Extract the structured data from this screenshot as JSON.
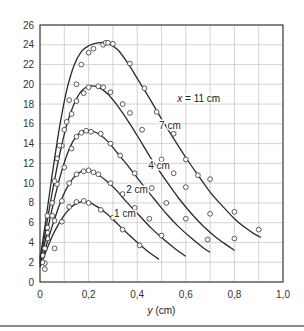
{
  "chart_data": {
    "type": "line",
    "title": "",
    "xlabel": "y (cm)",
    "xlabel_italic": "y",
    "xlabel_unit": " (cm)",
    "ylabel": "",
    "xlim": [
      0,
      1.0
    ],
    "ylim": [
      0,
      26
    ],
    "xticks": [
      0,
      0.2,
      0.4,
      0.6,
      0.8,
      1.0
    ],
    "xtick_labels": [
      "0",
      "0,2",
      "0,4",
      "0,6",
      "0,8",
      "1,0"
    ],
    "xgrid": [
      0,
      0.1,
      0.2,
      0.3,
      0.4,
      0.5,
      0.6,
      0.7,
      0.8,
      0.9,
      1.0
    ],
    "yticks": [
      0,
      2,
      4,
      6,
      8,
      10,
      12,
      14,
      16,
      18,
      20,
      22,
      24,
      26
    ],
    "ytick_labels": [
      "0",
      "2",
      "4",
      "6",
      "8",
      "10",
      "12",
      "14",
      "16",
      "18",
      "20",
      "22",
      "24",
      "26"
    ],
    "grid": true,
    "legend": "inline curve labels",
    "series": [
      {
        "name": "1 cm",
        "label": "1 cm",
        "label_pos": [
          0.305,
          6.9
        ],
        "curve": [
          [
            0.0,
            1.5
          ],
          [
            0.02,
            2.8
          ],
          [
            0.05,
            4.6
          ],
          [
            0.08,
            6.0
          ],
          [
            0.11,
            7.1
          ],
          [
            0.14,
            7.8
          ],
          [
            0.17,
            8.1
          ],
          [
            0.2,
            8.05
          ],
          [
            0.23,
            7.7
          ],
          [
            0.27,
            7.0
          ],
          [
            0.31,
            6.1
          ],
          [
            0.36,
            4.9
          ],
          [
            0.41,
            3.8
          ],
          [
            0.46,
            2.8
          ],
          [
            0.49,
            2.3
          ]
        ],
        "points": [
          [
            0.02,
            1.3
          ],
          [
            0.02,
            1.9
          ],
          [
            0.06,
            3.4
          ],
          [
            0.09,
            6.1
          ],
          [
            0.12,
            7.6
          ],
          [
            0.15,
            8.1
          ],
          [
            0.18,
            8.2
          ],
          [
            0.2,
            8.0
          ],
          [
            0.25,
            7.3
          ],
          [
            0.3,
            6.5
          ],
          [
            0.34,
            5.3
          ],
          [
            0.41,
            3.7
          ]
        ]
      },
      {
        "name": "2 cm",
        "label": "2 cm",
        "label_pos": [
          0.355,
          9.4
        ],
        "curve": [
          [
            0.0,
            1.6
          ],
          [
            0.02,
            3.2
          ],
          [
            0.05,
            5.6
          ],
          [
            0.08,
            7.8
          ],
          [
            0.11,
            9.5
          ],
          [
            0.14,
            10.6
          ],
          [
            0.17,
            11.2
          ],
          [
            0.2,
            11.25
          ],
          [
            0.23,
            11.0
          ],
          [
            0.27,
            10.3
          ],
          [
            0.31,
            9.4
          ],
          [
            0.36,
            8.0
          ],
          [
            0.41,
            6.7
          ],
          [
            0.46,
            5.4
          ],
          [
            0.51,
            4.3
          ],
          [
            0.56,
            3.3
          ],
          [
            0.6,
            2.6
          ]
        ],
        "points": [
          [
            0.01,
            2.0
          ],
          [
            0.03,
            4.4
          ],
          [
            0.06,
            6.2
          ],
          [
            0.09,
            8.2
          ],
          [
            0.12,
            10.0
          ],
          [
            0.15,
            10.9
          ],
          [
            0.18,
            11.2
          ],
          [
            0.2,
            11.3
          ],
          [
            0.22,
            11.1
          ],
          [
            0.24,
            10.9
          ],
          [
            0.29,
            10.0
          ],
          [
            0.34,
            8.9
          ],
          [
            0.39,
            7.5
          ],
          [
            0.45,
            6.4
          ],
          [
            0.5,
            4.7
          ]
        ]
      },
      {
        "name": "4 cm",
        "label": "4 cm",
        "label_pos": [
          0.445,
          11.8
        ],
        "curve": [
          [
            0.0,
            1.8
          ],
          [
            0.02,
            4.0
          ],
          [
            0.05,
            7.4
          ],
          [
            0.08,
            10.4
          ],
          [
            0.11,
            12.8
          ],
          [
            0.14,
            14.4
          ],
          [
            0.17,
            15.2
          ],
          [
            0.21,
            15.3
          ],
          [
            0.24,
            15.0
          ],
          [
            0.28,
            14.2
          ],
          [
            0.32,
            13.0
          ],
          [
            0.37,
            11.5
          ],
          [
            0.42,
            9.9
          ],
          [
            0.47,
            8.4
          ],
          [
            0.52,
            6.9
          ],
          [
            0.57,
            5.6
          ],
          [
            0.62,
            4.5
          ],
          [
            0.67,
            3.5
          ],
          [
            0.7,
            3.0
          ]
        ],
        "points": [
          [
            0.01,
            2.6
          ],
          [
            0.03,
            5.0
          ],
          [
            0.05,
            6.7
          ],
          [
            0.07,
            9.9
          ],
          [
            0.1,
            11.6
          ],
          [
            0.13,
            13.5
          ],
          [
            0.15,
            14.7
          ],
          [
            0.17,
            15.1
          ],
          [
            0.19,
            15.3
          ],
          [
            0.21,
            15.2
          ],
          [
            0.25,
            15.0
          ],
          [
            0.29,
            14.0
          ],
          [
            0.33,
            12.8
          ],
          [
            0.39,
            11.0
          ],
          [
            0.46,
            9.5
          ],
          [
            0.52,
            8.0
          ],
          [
            0.6,
            6.4
          ],
          [
            0.69,
            4.3
          ]
        ]
      },
      {
        "name": "7 cm",
        "label": "7 cm",
        "label_pos": [
          0.49,
          15.8
        ],
        "curve": [
          [
            0.0,
            2.0
          ],
          [
            0.02,
            4.8
          ],
          [
            0.05,
            9.0
          ],
          [
            0.08,
            12.8
          ],
          [
            0.11,
            15.9
          ],
          [
            0.14,
            18.0
          ],
          [
            0.17,
            19.3
          ],
          [
            0.2,
            19.8
          ],
          [
            0.24,
            19.7
          ],
          [
            0.28,
            19.0
          ],
          [
            0.32,
            17.8
          ],
          [
            0.37,
            16.0
          ],
          [
            0.42,
            14.0
          ],
          [
            0.47,
            12.0
          ],
          [
            0.52,
            10.2
          ],
          [
            0.57,
            8.5
          ],
          [
            0.62,
            7.0
          ],
          [
            0.67,
            5.7
          ],
          [
            0.72,
            4.6
          ],
          [
            0.77,
            3.7
          ],
          [
            0.8,
            3.2
          ]
        ],
        "points": [
          [
            0.01,
            2.7
          ],
          [
            0.03,
            5.5
          ],
          [
            0.05,
            8.0
          ],
          [
            0.07,
            12.5
          ],
          [
            0.09,
            13.8
          ],
          [
            0.11,
            16.2
          ],
          [
            0.13,
            17.0
          ],
          [
            0.15,
            18.3
          ],
          [
            0.18,
            19.1
          ],
          [
            0.2,
            19.7
          ],
          [
            0.24,
            19.8
          ],
          [
            0.26,
            19.7
          ],
          [
            0.29,
            19.2
          ],
          [
            0.34,
            18.0
          ],
          [
            0.37,
            17.1
          ],
          [
            0.42,
            15.4
          ],
          [
            0.5,
            12.4
          ],
          [
            0.55,
            11.0
          ],
          [
            0.6,
            9.6
          ],
          [
            0.7,
            6.9
          ],
          [
            0.8,
            4.4
          ]
        ]
      },
      {
        "name": "11 cm",
        "label": "x = 11 cm",
        "label_italic": "x",
        "label_rest": " = 11 cm",
        "label_pos": [
          0.565,
          18.6
        ],
        "curve": [
          [
            0.0,
            2.3
          ],
          [
            0.02,
            5.6
          ],
          [
            0.05,
            10.8
          ],
          [
            0.08,
            15.6
          ],
          [
            0.11,
            19.4
          ],
          [
            0.14,
            21.9
          ],
          [
            0.17,
            23.3
          ],
          [
            0.2,
            23.9
          ],
          [
            0.24,
            24.2
          ],
          [
            0.28,
            24.15
          ],
          [
            0.32,
            23.5
          ],
          [
            0.36,
            22.2
          ],
          [
            0.4,
            20.6
          ],
          [
            0.45,
            18.6
          ],
          [
            0.5,
            16.5
          ],
          [
            0.55,
            14.5
          ],
          [
            0.6,
            12.6
          ],
          [
            0.65,
            10.8
          ],
          [
            0.7,
            9.1
          ],
          [
            0.75,
            7.7
          ],
          [
            0.8,
            6.4
          ],
          [
            0.85,
            5.4
          ],
          [
            0.88,
            4.9
          ],
          [
            0.91,
            4.5
          ]
        ],
        "points": [
          [
            0.02,
            3.4
          ],
          [
            0.03,
            6.7
          ],
          [
            0.06,
            10.2
          ],
          [
            0.08,
            13.8
          ],
          [
            0.1,
            15.4
          ],
          [
            0.12,
            18.4
          ],
          [
            0.15,
            20.0
          ],
          [
            0.17,
            22.0
          ],
          [
            0.2,
            23.2
          ],
          [
            0.22,
            23.6
          ],
          [
            0.26,
            24.0
          ],
          [
            0.27,
            24.2
          ],
          [
            0.28,
            24.2
          ],
          [
            0.3,
            24.1
          ],
          [
            0.37,
            22.1
          ],
          [
            0.43,
            19.6
          ],
          [
            0.48,
            17.2
          ],
          [
            0.55,
            15.0
          ],
          [
            0.6,
            12.4
          ],
          [
            0.65,
            10.8
          ],
          [
            0.7,
            10.4
          ],
          [
            0.8,
            7.1
          ],
          [
            0.9,
            5.3
          ]
        ]
      }
    ]
  },
  "axis": {
    "xlabel_var": "y",
    "xlabel_unit": " (cm)"
  }
}
